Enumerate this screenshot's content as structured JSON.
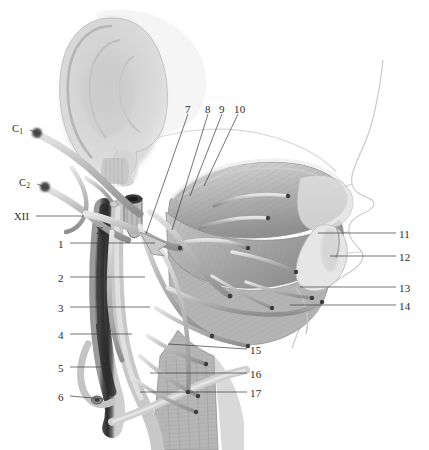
{
  "figure": {
    "type": "anatomical-illustration",
    "background_color": "#ffffff",
    "line_color": "#3a3a3a",
    "label_color": "#2a2a2a",
    "tissue_tone_light": "#d8d8d8",
    "tissue_tone_mid": "#a8a8a8",
    "tissue_tone_dark": "#5a5a5a",
    "vein_dark": "#3c3c3c"
  },
  "labels": {
    "roman": [
      {
        "id": "c1",
        "text": "C",
        "sub": "1",
        "x": 12,
        "y": 124,
        "leader": {
          "x1": 30,
          "y1": 130,
          "x2": 40,
          "y2": 134
        }
      },
      {
        "id": "c2",
        "text": "C",
        "sub": "2",
        "x": 19,
        "y": 178,
        "leader": {
          "x1": 37,
          "y1": 184,
          "x2": 48,
          "y2": 188
        }
      },
      {
        "id": "xii",
        "text": "XII",
        "sub": "",
        "x": 14,
        "y": 212,
        "leader": {
          "x1": 36,
          "y1": 216,
          "x2": 84,
          "y2": 216
        }
      },
      {
        "id": "x",
        "text": "X",
        "sub": "",
        "x": 96,
        "y": 226,
        "leader": null
      }
    ],
    "left": [
      {
        "n": "1",
        "x": 58,
        "y": 239,
        "leader": {
          "x1": 70,
          "y1": 243,
          "x2": 155,
          "y2": 243
        }
      },
      {
        "n": "2",
        "x": 58,
        "y": 273,
        "leader": {
          "x1": 70,
          "y1": 277,
          "x2": 145,
          "y2": 277
        }
      },
      {
        "n": "3",
        "x": 58,
        "y": 303,
        "leader": {
          "x1": 70,
          "y1": 307,
          "x2": 150,
          "y2": 307
        }
      },
      {
        "n": "4",
        "x": 58,
        "y": 330,
        "leader": {
          "x1": 70,
          "y1": 334,
          "x2": 132,
          "y2": 334
        }
      },
      {
        "n": "5",
        "x": 58,
        "y": 363,
        "leader": {
          "x1": 70,
          "y1": 367,
          "x2": 110,
          "y2": 367
        }
      },
      {
        "n": "6",
        "x": 58,
        "y": 392,
        "leader": {
          "x1": 70,
          "y1": 396,
          "x2": 104,
          "y2": 399
        }
      }
    ],
    "top": [
      {
        "n": "7",
        "x": 185,
        "y": 104,
        "leader": {
          "x1": 188,
          "y1": 114,
          "x2": 146,
          "y2": 234
        }
      },
      {
        "n": "8",
        "x": 205,
        "y": 104,
        "leader": {
          "x1": 208,
          "y1": 114,
          "x2": 172,
          "y2": 230
        }
      },
      {
        "n": "9",
        "x": 219,
        "y": 104,
        "leader": {
          "x1": 222,
          "y1": 114,
          "x2": 190,
          "y2": 196
        }
      },
      {
        "n": "10",
        "x": 234,
        "y": 104,
        "leader": {
          "x1": 238,
          "y1": 114,
          "x2": 204,
          "y2": 186
        }
      }
    ],
    "right": [
      {
        "n": "11",
        "x": 399,
        "y": 229,
        "leader": {
          "x1": 396,
          "y1": 233,
          "x2": 318,
          "y2": 233
        }
      },
      {
        "n": "12",
        "x": 399,
        "y": 252,
        "leader": {
          "x1": 396,
          "y1": 256,
          "x2": 330,
          "y2": 256
        }
      },
      {
        "n": "13",
        "x": 399,
        "y": 283,
        "leader": {
          "x1": 396,
          "y1": 287,
          "x2": 300,
          "y2": 287
        }
      },
      {
        "n": "14",
        "x": 399,
        "y": 301,
        "leader": {
          "x1": 396,
          "y1": 305,
          "x2": 290,
          "y2": 305
        }
      }
    ],
    "lower_right": [
      {
        "n": "15",
        "x": 250,
        "y": 345,
        "leader": {
          "x1": 247,
          "y1": 349,
          "x2": 168,
          "y2": 344
        }
      },
      {
        "n": "16",
        "x": 250,
        "y": 369,
        "leader": {
          "x1": 247,
          "y1": 373,
          "x2": 150,
          "y2": 373
        }
      },
      {
        "n": "17",
        "x": 250,
        "y": 388,
        "leader": {
          "x1": 247,
          "y1": 392,
          "x2": 140,
          "y2": 392
        }
      }
    ]
  }
}
